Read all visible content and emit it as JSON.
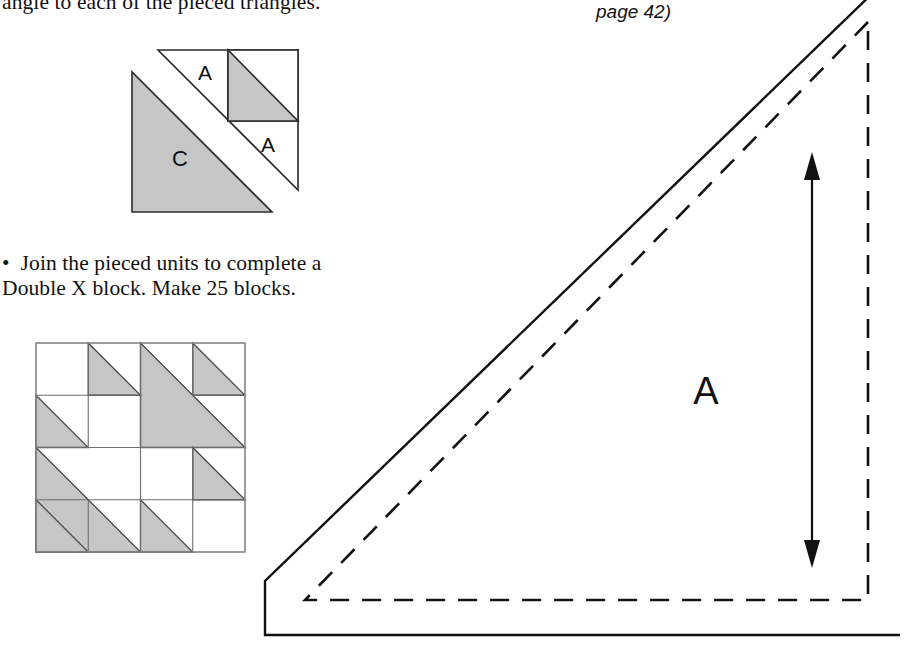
{
  "page": {
    "width": 910,
    "height": 650,
    "background": "#ffffff",
    "ink": "#111111",
    "shade_fill": "#c3c3c3",
    "line_color": "#2b2b2b"
  },
  "instructions": {
    "top_text": "angle to each of the pieced triangles.",
    "join_line1": "•  Join the pieced units to complete a",
    "join_line2": "Double X block. Make 25 blocks.",
    "page_reference": "page 42)"
  },
  "figures": {
    "pieced_unit": {
      "name": "pieced-triangle-unit-diagram",
      "labels": {
        "large_triangle": "C",
        "small_triangle_upper": "A",
        "small_triangle_lower": "A"
      }
    },
    "double_x_block": {
      "name": "double-x-block-diagram",
      "grid": 4,
      "description": "Double X quilt block",
      "cells": [
        {
          "row": 0,
          "col": 0,
          "type": "plain"
        },
        {
          "row": 0,
          "col": 1,
          "type": "hst",
          "orient": "tl-br-lower-right"
        },
        {
          "row": 0,
          "col": 3,
          "type": "hst",
          "orient": "tl-br-lower-right"
        },
        {
          "row": 1,
          "col": 0,
          "type": "hst",
          "orient": "tl-br-lower-right"
        },
        {
          "row": 1,
          "col": 1,
          "type": "plain"
        },
        {
          "row": 2,
          "col": 2,
          "type": "plain"
        },
        {
          "row": 2,
          "col": 3,
          "type": "hst",
          "orient": "tl-br-lower-right"
        },
        {
          "row": 3,
          "col": 0,
          "type": "hst",
          "orient": "tl-br-lower-right"
        },
        {
          "row": 3,
          "col": 2,
          "type": "hst",
          "orient": "tl-br-lower-right"
        },
        {
          "row": 3,
          "col": 3,
          "type": "plain"
        }
      ],
      "large_triangles": [
        {
          "name": "upper-right-large-triangle",
          "span": "cols 2-3, rows 0-1"
        },
        {
          "name": "lower-left-large-triangle",
          "span": "cols 0-1, rows 2-3"
        }
      ]
    },
    "template_a": {
      "name": "template-piece-a",
      "label": "A",
      "cut_line": "solid",
      "seam_line": "dashed",
      "has_grainline_arrow": true
    }
  }
}
